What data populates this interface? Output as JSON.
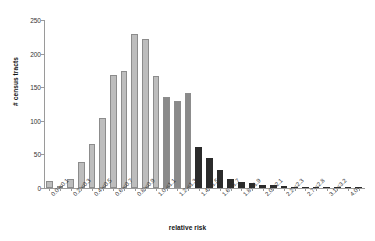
{
  "chart_data": {
    "type": "bar",
    "title": "",
    "subtitle": "",
    "xlabel": "relative risk",
    "ylabel": "# census tracts",
    "ylim": [
      0,
      250
    ],
    "yticks": [
      0,
      50,
      100,
      150,
      200,
      250
    ],
    "grid": false,
    "legend": null,
    "annotations": [],
    "bar_colors": {
      "light": "#bdbdbd",
      "mid": "#8a8a8a",
      "dark": "#2b2b2b",
      "edge": "#8c8c8c"
    },
    "categories": [
      "0.0-<0.1",
      "0.1-<0.2",
      "0.2-<0.3",
      "0.3-<0.4",
      "0.4-<0.5",
      "0.5-<0.6",
      "0.6-<0.7",
      "0.7-<0.8",
      "0.8-<0.9",
      "0.9-<1.0",
      "1.0-<1.1",
      "1.1-<1.2",
      "1.2-<1.3",
      "1.3-<1.4",
      "1.4-<1.5",
      "1.5-<1.6",
      "1.6-<1.7",
      "1.7-<1.8",
      "1.8-<1.9",
      "1.9-<2.0",
      "2.0-<2.1",
      "2.1-<2.2",
      "2.2-<2.3",
      "2.3-<2.4",
      "2.7-<2.8",
      "2.8-<2.9",
      "3.1-<3.2",
      "3.2-<3.3",
      "4.0+",
      "4.1+"
    ],
    "tick_labels_shown": [
      "0.0-<0.1",
      "0.2-<0.3",
      "0.4-<0.5",
      "0.6-<0.7",
      "0.8-<0.9",
      "1.0-<1.1",
      "1.2-<1.3",
      "1.4-<1.5",
      "1.6-<1.7",
      "1.8-<1.9",
      "2.0-<2.1",
      "2.2-<2.3",
      "2.7-<2.8",
      "3.1-<3.2",
      "4.0+"
    ],
    "values": [
      11,
      1,
      13,
      38,
      66,
      104,
      168,
      174,
      229,
      222,
      166,
      135,
      129,
      141,
      61,
      45,
      27,
      14,
      9,
      7,
      5,
      4,
      3,
      2,
      2,
      1,
      1,
      1,
      2,
      1
    ],
    "shades": [
      "light",
      "light",
      "light",
      "light",
      "light",
      "light",
      "light",
      "light",
      "light",
      "light",
      "light",
      "mid",
      "mid",
      "mid",
      "dark",
      "dark",
      "dark",
      "dark",
      "dark",
      "dark",
      "dark",
      "dark",
      "dark",
      "dark",
      "dark",
      "dark",
      "dark",
      "dark",
      "dark",
      "dark"
    ]
  }
}
